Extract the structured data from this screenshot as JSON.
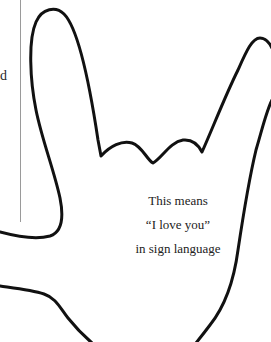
{
  "page": {
    "background": "#ffffff",
    "top_text_fragment": "ople yo e  ou  e  e  l  ng",
    "side_text_fragment": "d"
  },
  "figure": {
    "type": "hand-outline-illustration",
    "stroke_color": "#111111",
    "caption": {
      "line1": "This means",
      "line2": "“I love you”",
      "line3": "in sign language"
    }
  }
}
